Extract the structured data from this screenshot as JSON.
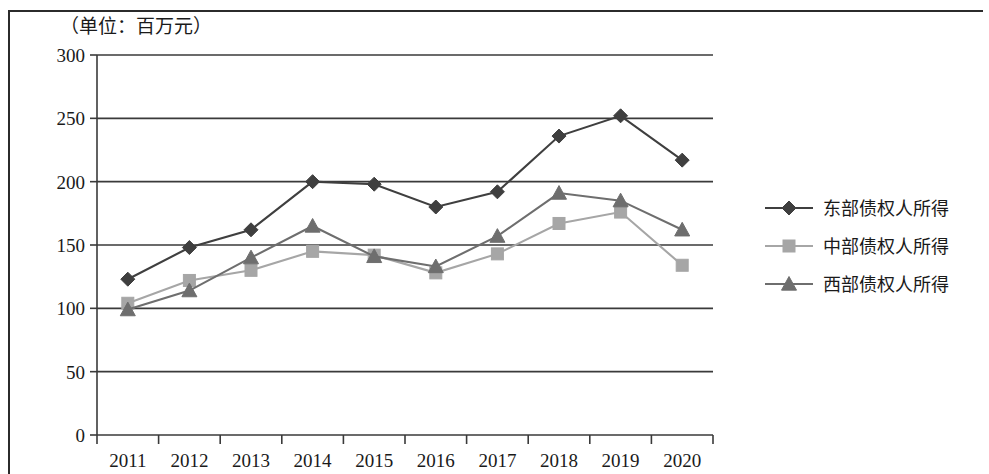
{
  "chart_data": {
    "type": "line",
    "title": "（单位：百万元）",
    "xlabel": "",
    "ylabel": "",
    "categories": [
      "2011",
      "2012",
      "2013",
      "2014",
      "2015",
      "2016",
      "2017",
      "2018",
      "2019",
      "2020"
    ],
    "ylim": [
      0,
      300
    ],
    "ytick_step": 50,
    "yticks": [
      "0",
      "50",
      "100",
      "150",
      "200",
      "250",
      "300"
    ],
    "grid": true,
    "legend_position": "right",
    "series": [
      {
        "name": "东部债权人所得",
        "marker": "diamond",
        "color": "#3f3f3f",
        "values": [
          123,
          148,
          162,
          200,
          198,
          180,
          192,
          236,
          252,
          217
        ]
      },
      {
        "name": "中部债权人所得",
        "marker": "square",
        "color": "#a6a6a6",
        "values": [
          104,
          122,
          130,
          145,
          142,
          128,
          143,
          167,
          176,
          134
        ]
      },
      {
        "name": "西部债权人所得",
        "marker": "triangle",
        "color": "#6e6e6e",
        "values": [
          99,
          114,
          140,
          165,
          141,
          133,
          157,
          191,
          185,
          162
        ]
      }
    ]
  },
  "legend": {
    "items": [
      {
        "label": "东部债权人所得"
      },
      {
        "label": "中部债权人所得"
      },
      {
        "label": "西部债权人所得"
      }
    ]
  },
  "axes": {
    "y_title": "（单位：百万元）"
  }
}
